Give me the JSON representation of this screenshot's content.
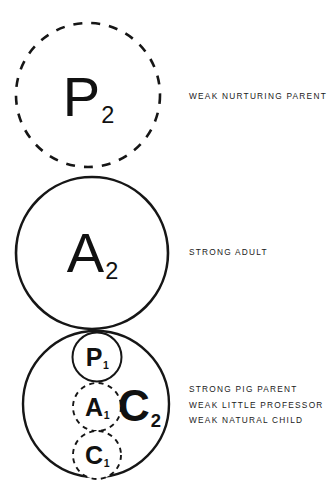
{
  "figure": {
    "background_color": "#ffffff",
    "ink_color": "#161616",
    "circles": [
      {
        "id": "p2",
        "glyph": "P",
        "subscript": "2",
        "style": "dashed",
        "cx": 88,
        "cy": 95,
        "r": 72,
        "stroke_width": 2.6,
        "font_size": 56,
        "weight": "thin"
      },
      {
        "id": "a2",
        "glyph": "A",
        "subscript": "2",
        "style": "solid",
        "cx": 92,
        "cy": 253,
        "r": 76,
        "stroke_width": 2.6,
        "font_size": 56,
        "weight": "thin"
      },
      {
        "id": "c2",
        "glyph": "C",
        "subscript": "2",
        "style": "solid",
        "cx": 96,
        "cy": 404,
        "r": 73,
        "stroke_width": 2.4,
        "font_size": 44,
        "weight": "bold"
      },
      {
        "id": "p1",
        "glyph": "P",
        "subscript": "1",
        "style": "solid",
        "cx": 97,
        "cy": 357,
        "r": 24.5,
        "stroke_width": 2.0,
        "font_size": 25,
        "weight": "bold"
      },
      {
        "id": "a1",
        "glyph": "A",
        "subscript": "1",
        "style": "dashed",
        "cx": 97,
        "cy": 407,
        "r": 24,
        "stroke_width": 1.9,
        "font_size": 25,
        "weight": "bold"
      },
      {
        "id": "c1",
        "glyph": "C",
        "subscript": "1",
        "style": "dashed",
        "cx": 97,
        "cy": 455,
        "r": 24,
        "stroke_width": 1.9,
        "font_size": 25,
        "weight": "bold"
      }
    ],
    "glyph_positions": {
      "p2": {
        "x": 88,
        "y": 97
      },
      "a2": {
        "x": 92,
        "y": 253
      },
      "c2": {
        "x": 139,
        "y": 406
      },
      "p1": {
        "x": 97,
        "y": 357
      },
      "a1": {
        "x": 97,
        "y": 407
      },
      "c1": {
        "x": 97,
        "y": 455
      }
    }
  },
  "annotations": {
    "parent": {
      "top": 89,
      "lines": [
        "WEAK NURTURING PARENT"
      ]
    },
    "adult": {
      "top": 245,
      "lines": [
        "STRONG ADULT"
      ]
    },
    "child": {
      "top": 382,
      "lines": [
        "STRONG PIG PARENT",
        "WEAK LITTLE PROFESSOR",
        "WEAK NATURAL CHILD"
      ]
    }
  }
}
